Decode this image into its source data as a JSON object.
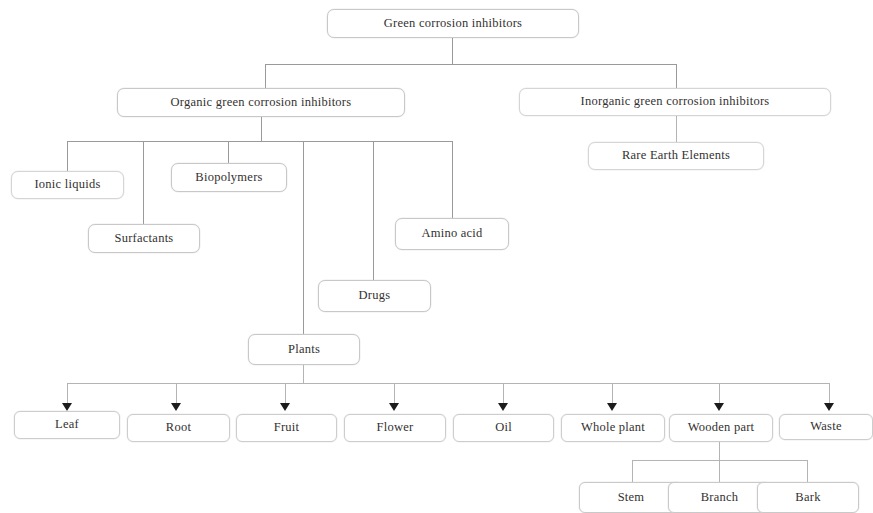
{
  "diagram": {
    "type": "tree-diagram",
    "root": {
      "label": "Green corrosion inhibitors"
    },
    "level1": [
      {
        "label": "Organic green corrosion inhibitors"
      },
      {
        "label": "Inorganic green corrosion inhibitors"
      }
    ],
    "organic_children": [
      {
        "label": "Ionic liquids"
      },
      {
        "label": "Surfactants"
      },
      {
        "label": "Biopolymers"
      },
      {
        "label": "Plants"
      },
      {
        "label": "Drugs"
      },
      {
        "label": "Amino acid"
      }
    ],
    "inorganic_children": [
      {
        "label": "Rare Earth Elements"
      }
    ],
    "plant_parts": [
      {
        "label": "Leaf"
      },
      {
        "label": "Root"
      },
      {
        "label": "Fruit"
      },
      {
        "label": "Flower"
      },
      {
        "label": "Oil"
      },
      {
        "label": "Whole plant"
      },
      {
        "label": "Wooden part"
      },
      {
        "label": "Waste"
      }
    ],
    "wooden_part_children": [
      {
        "label": "Stem"
      },
      {
        "label": "Branch"
      },
      {
        "label": "Bark"
      }
    ],
    "colors": {
      "node_border": "#c8c8c8",
      "connector": "#9a9a9a",
      "arrow": "#1c1c1c",
      "text": "#33312f",
      "background": "#ffffff"
    }
  }
}
